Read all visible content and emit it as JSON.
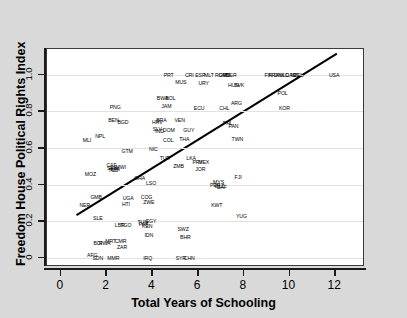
{
  "chart_data": {
    "type": "scatter",
    "title": "",
    "xlabel": "Total Years of Schooling",
    "ylabel": "Freedom House Political Rights Index",
    "xlim": [
      -0.6,
      13.3
    ],
    "ylim": [
      -0.05,
      1.14
    ],
    "xticks": [
      0,
      2,
      4,
      6,
      8,
      10,
      12
    ],
    "xtick_labels": [
      "0",
      "2",
      "4",
      "6",
      "8",
      "10",
      "12"
    ],
    "yticks": [
      0,
      0.2,
      0.4,
      0.6,
      0.8,
      1.0
    ],
    "ytick_labels": [
      "0",
      "0.2",
      "0.4",
      "0.6",
      "0.8",
      "1.0"
    ],
    "grid": true,
    "grid_axis": "y",
    "marker_style": "text-label",
    "legend": "none",
    "fit_line": {
      "label": "linear fit",
      "x0": 0.7,
      "y0": 0.225,
      "x1": 12.15,
      "y1": 1.115,
      "color": "#000000"
    },
    "points": [
      {
        "label": "MLI",
        "x": 1.15,
        "y": 0.645
      },
      {
        "label": "NPL",
        "x": 1.72,
        "y": 0.665
      },
      {
        "label": "PNG",
        "x": 2.38,
        "y": 0.825
      },
      {
        "label": "BEN",
        "x": 2.3,
        "y": 0.755
      },
      {
        "label": "BGD",
        "x": 2.72,
        "y": 0.74
      },
      {
        "label": "MOZ",
        "x": 1.3,
        "y": 0.455
      },
      {
        "label": "GMB",
        "x": 1.55,
        "y": 0.33
      },
      {
        "label": "NER",
        "x": 1.05,
        "y": 0.29
      },
      {
        "label": "SLE",
        "x": 1.62,
        "y": 0.215
      },
      {
        "label": "CAF",
        "x": 2.22,
        "y": 0.505
      },
      {
        "label": "SEN",
        "x": 2.25,
        "y": 0.49
      },
      {
        "label": "BFA",
        "x": 2.38,
        "y": 0.487
      },
      {
        "label": "TCD",
        "x": 2.3,
        "y": 0.478
      },
      {
        "label": "MWI",
        "x": 2.62,
        "y": 0.497
      },
      {
        "label": "GTM",
        "x": 2.9,
        "y": 0.585
      },
      {
        "label": "UGA",
        "x": 2.95,
        "y": 0.325
      },
      {
        "label": "HTI",
        "x": 2.85,
        "y": 0.293
      },
      {
        "label": "GHA",
        "x": 3.45,
        "y": 0.437
      },
      {
        "label": "LBR",
        "x": 2.58,
        "y": 0.178
      },
      {
        "label": "TGO",
        "x": 2.85,
        "y": 0.178
      },
      {
        "label": "BDI",
        "x": 1.62,
        "y": 0.083
      },
      {
        "label": "RWA",
        "x": 1.92,
        "y": 0.083
      },
      {
        "label": "MRT",
        "x": 2.18,
        "y": 0.092
      },
      {
        "label": "CMR",
        "x": 2.62,
        "y": 0.09
      },
      {
        "label": "ZAR",
        "x": 2.68,
        "y": 0.06
      },
      {
        "label": "AFG",
        "x": 1.38,
        "y": 0.013
      },
      {
        "label": "SDN",
        "x": 1.62,
        "y": 0.0
      },
      {
        "label": "MMR",
        "x": 2.3,
        "y": 0.0
      },
      {
        "label": "NIC",
        "x": 4.05,
        "y": 0.595
      },
      {
        "label": "TUR",
        "x": 4.55,
        "y": 0.545
      },
      {
        "label": "BWA",
        "x": 4.45,
        "y": 0.875
      },
      {
        "label": "BOL",
        "x": 4.8,
        "y": 0.875
      },
      {
        "label": "JAM",
        "x": 4.62,
        "y": 0.83
      },
      {
        "label": "BRA",
        "x": 4.4,
        "y": 0.755
      },
      {
        "label": "HRV",
        "x": 4.22,
        "y": 0.74
      },
      {
        "label": "SLV",
        "x": 4.22,
        "y": 0.705
      },
      {
        "label": "IND",
        "x": 4.32,
        "y": 0.69
      },
      {
        "label": "DOM",
        "x": 4.72,
        "y": 0.7
      },
      {
        "label": "COL",
        "x": 4.7,
        "y": 0.645
      },
      {
        "label": "VEN",
        "x": 5.2,
        "y": 0.752
      },
      {
        "label": "LSO",
        "x": 3.95,
        "y": 0.41
      },
      {
        "label": "COG",
        "x": 3.75,
        "y": 0.33
      },
      {
        "label": "ZWE",
        "x": 3.85,
        "y": 0.305
      },
      {
        "label": "TUN",
        "x": 3.58,
        "y": 0.195
      },
      {
        "label": "EGY",
        "x": 3.95,
        "y": 0.203
      },
      {
        "label": "PAK",
        "x": 3.62,
        "y": 0.182
      },
      {
        "label": "KEN",
        "x": 3.78,
        "y": 0.172
      },
      {
        "label": "IDN",
        "x": 3.85,
        "y": 0.123
      },
      {
        "label": "IRQ",
        "x": 3.8,
        "y": 0.0
      },
      {
        "label": "ZMB",
        "x": 5.15,
        "y": 0.5
      },
      {
        "label": "THA",
        "x": 5.4,
        "y": 0.65
      },
      {
        "label": "GUY",
        "x": 5.6,
        "y": 0.7
      },
      {
        "label": "ECU",
        "x": 6.05,
        "y": 0.82
      },
      {
        "label": "LKA",
        "x": 5.7,
        "y": 0.545
      },
      {
        "label": "PRY",
        "x": 5.98,
        "y": 0.525
      },
      {
        "label": "MEX",
        "x": 6.25,
        "y": 0.525
      },
      {
        "label": "JOR",
        "x": 6.1,
        "y": 0.485
      },
      {
        "label": "SWZ",
        "x": 5.35,
        "y": 0.16
      },
      {
        "label": "BHR",
        "x": 5.45,
        "y": 0.115
      },
      {
        "label": "SYR",
        "x": 5.25,
        "y": 0.0
      },
      {
        "label": "CHN",
        "x": 5.62,
        "y": 0.0
      },
      {
        "label": "PRT",
        "x": 4.72,
        "y": 1.0
      },
      {
        "label": "CRI",
        "x": 5.62,
        "y": 1.0
      },
      {
        "label": "MUS",
        "x": 5.25,
        "y": 0.96
      },
      {
        "label": "ESP",
        "x": 6.1,
        "y": 1.0
      },
      {
        "label": "MLT",
        "x": 6.48,
        "y": 1.0
      },
      {
        "label": "URY",
        "x": 6.25,
        "y": 0.955
      },
      {
        "label": "ROM",
        "x": 7.0,
        "y": 1.0
      },
      {
        "label": "GRC",
        "x": 7.15,
        "y": 1.0
      },
      {
        "label": "ITA",
        "x": 7.3,
        "y": 1.0
      },
      {
        "label": "BGR",
        "x": 7.45,
        "y": 1.0
      },
      {
        "label": "HUN",
        "x": 7.55,
        "y": 0.945
      },
      {
        "label": "SVK",
        "x": 7.8,
        "y": 0.945
      },
      {
        "label": "CHL",
        "x": 7.15,
        "y": 0.82
      },
      {
        "label": "ARG",
        "x": 7.68,
        "y": 0.845
      },
      {
        "label": "PHL",
        "x": 7.3,
        "y": 0.735
      },
      {
        "label": "PAN",
        "x": 7.55,
        "y": 0.722
      },
      {
        "label": "TWN",
        "x": 7.72,
        "y": 0.65
      },
      {
        "label": "FJI",
        "x": 7.75,
        "y": 0.44
      },
      {
        "label": "MYS",
        "x": 6.9,
        "y": 0.412
      },
      {
        "label": "PER",
        "x": 6.75,
        "y": 0.395
      },
      {
        "label": "BLZ",
        "x": 6.95,
        "y": 0.392
      },
      {
        "label": "ZAF",
        "x": 7.05,
        "y": 0.388
      },
      {
        "label": "KWT",
        "x": 6.82,
        "y": 0.287
      },
      {
        "label": "YUG",
        "x": 7.9,
        "y": 0.228
      },
      {
        "label": "FIN",
        "x": 9.08,
        "y": 1.0
      },
      {
        "label": "FRA",
        "x": 9.3,
        "y": 1.0
      },
      {
        "label": "DNK",
        "x": 9.55,
        "y": 1.0
      },
      {
        "label": "NLD",
        "x": 9.75,
        "y": 1.0
      },
      {
        "label": "CAN",
        "x": 10.05,
        "y": 1.0
      },
      {
        "label": "NZL",
        "x": 10.25,
        "y": 1.0
      },
      {
        "label": "DEU",
        "x": 10.4,
        "y": 1.0
      },
      {
        "label": "POL",
        "x": 9.7,
        "y": 0.9
      },
      {
        "label": "KOR",
        "x": 9.78,
        "y": 0.82
      },
      {
        "label": "USA",
        "x": 11.95,
        "y": 1.0
      }
    ]
  }
}
